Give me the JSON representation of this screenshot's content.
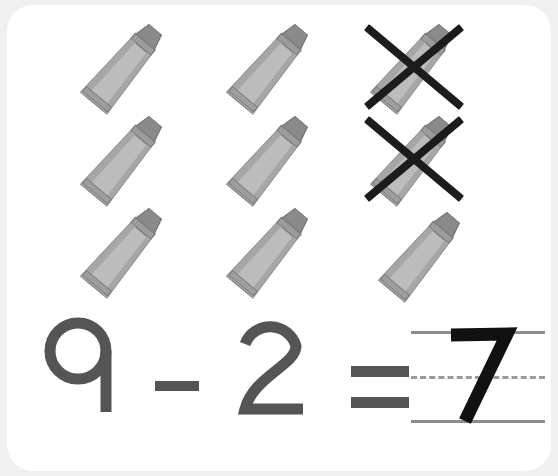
{
  "card": {
    "background_color": "#ffffff",
    "page_background_color": "#f0f0f0",
    "corner_radius_px": 26
  },
  "worksheet": {
    "type": "subtraction-picture-problem",
    "subject": "math",
    "object_name": "crayon",
    "object_icon": "crayon-icon",
    "total_objects": 9,
    "crossed_out_objects": 2,
    "remaining_objects": 7,
    "grid": {
      "columns": 3,
      "rows": 3
    },
    "cross_out_mark": "x-mark"
  },
  "objects": [
    {
      "index": 1,
      "row": 1,
      "column": 1,
      "crossed_out": false
    },
    {
      "index": 2,
      "row": 1,
      "column": 2,
      "crossed_out": false
    },
    {
      "index": 3,
      "row": 1,
      "column": 3,
      "crossed_out": true
    },
    {
      "index": 4,
      "row": 2,
      "column": 1,
      "crossed_out": false
    },
    {
      "index": 5,
      "row": 2,
      "column": 2,
      "crossed_out": false
    },
    {
      "index": 6,
      "row": 2,
      "column": 3,
      "crossed_out": true
    },
    {
      "index": 7,
      "row": 3,
      "column": 1,
      "crossed_out": false
    },
    {
      "index": 8,
      "row": 3,
      "column": 2,
      "crossed_out": false
    },
    {
      "index": 9,
      "row": 3,
      "column": 3,
      "crossed_out": false
    }
  ],
  "equation": {
    "minuend": "9",
    "operator": "-",
    "operator_name": "minus-sign",
    "subtrahend": "2",
    "equals": "=",
    "equals_name": "equals-sign",
    "answer": "7",
    "answer_filled_in": true,
    "expression": "9 - 2 = 7"
  },
  "answer_area": {
    "guide_lines": [
      "solid",
      "dashed",
      "solid"
    ],
    "handwriting_color": "#111111",
    "guide_line_color": "#8c8c8c"
  },
  "colors": {
    "digit_color": "#555555",
    "crayon_body": "#b4b4b4",
    "crayon_body_light": "#c4c4c4",
    "crayon_band_dark": "#8f8f8f",
    "crayon_tip": "#8a8a8a",
    "crayon_outline": "#7d7d7d",
    "cross_out_color": "#1c1c1c"
  }
}
